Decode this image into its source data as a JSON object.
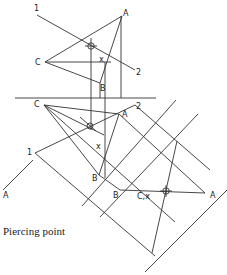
{
  "diagram": {
    "title": "Piercing point",
    "top_view": {
      "labels": {
        "line_end_1": "1",
        "line_end_2": "2",
        "A": "A",
        "B": "B",
        "C": "C",
        "x": "x"
      }
    },
    "front_view": {
      "labels": {
        "line_end_1": "1",
        "line_end_2": "2",
        "A": "A",
        "B": "B",
        "C": "C",
        "x": "x"
      }
    },
    "auxiliary_view": {
      "labels": {
        "A_left": "A",
        "A_right": "A",
        "B": "B",
        "Cx": "C,x"
      }
    }
  }
}
